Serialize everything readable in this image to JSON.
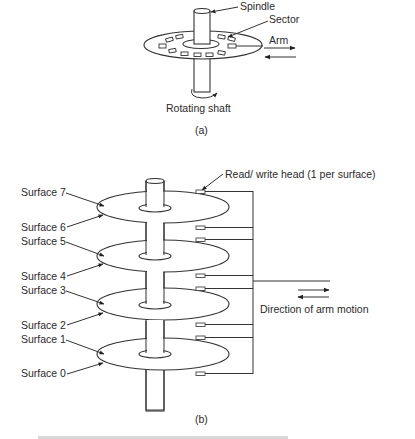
{
  "figure_a": {
    "labels": {
      "spindle": "Spindle",
      "sector": "Sector",
      "arm": "Arm",
      "rotating_shaft": "Rotating shaft"
    },
    "caption": "(a)"
  },
  "figure_b": {
    "head_label": "Read/ write head (1 per surface)",
    "arm_motion_label": "Direction of arm motion",
    "surfaces": [
      {
        "label": "Surface 7"
      },
      {
        "label": "Surface 6"
      },
      {
        "label": "Surface 5"
      },
      {
        "label": "Surface 4"
      },
      {
        "label": "Surface 3"
      },
      {
        "label": "Surface 2"
      },
      {
        "label": "Surface 1"
      },
      {
        "label": "Surface 0"
      }
    ],
    "platter_count": 4,
    "head_count": 8,
    "caption": "(b)"
  },
  "colors": {
    "line": "#333333",
    "text": "#2a2a2a",
    "background": "#ffffff"
  }
}
